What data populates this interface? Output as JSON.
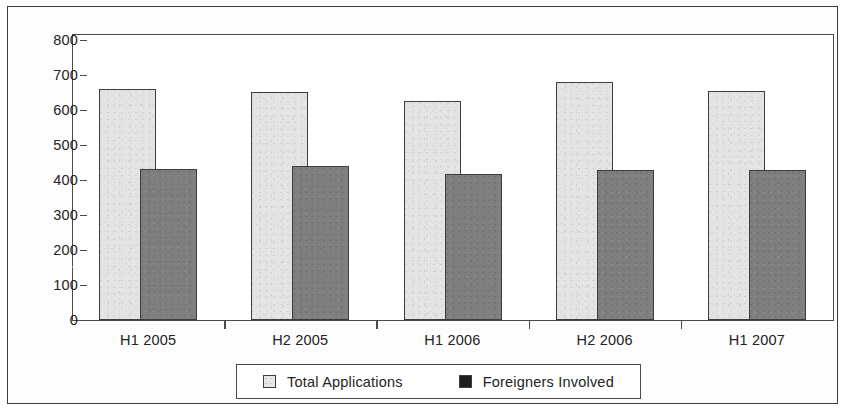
{
  "chart_data": {
    "type": "bar",
    "title": "",
    "subtitle": "",
    "xlabel": "",
    "ylabel": "",
    "categories": [
      "H1 2005",
      "H2 2005",
      "H1 2006",
      "H2 2006",
      "H1 2007"
    ],
    "series": [
      {
        "name": "Total Applications",
        "color": "#e4e4e4",
        "values": [
          660,
          652,
          625,
          680,
          653
        ]
      },
      {
        "name": "Foreigners Involved",
        "color": "#7f7f7f",
        "values": [
          432,
          441,
          418,
          430,
          429
        ]
      }
    ],
    "ylim": [
      0,
      800
    ],
    "y_ticks": [
      0,
      100,
      200,
      300,
      400,
      500,
      600,
      700,
      800
    ],
    "y_tick_labels": [
      "0",
      "100",
      "200",
      "300",
      "400",
      "500",
      "600",
      "700",
      "800"
    ],
    "grid": false,
    "legend": {
      "position": "bottom",
      "entries": [
        {
          "label": "Total Applications",
          "swatch": "light-swatch-icon"
        },
        {
          "label": "Foreigners Involved",
          "swatch": "dark-swatch-icon"
        }
      ]
    },
    "annotations": []
  }
}
